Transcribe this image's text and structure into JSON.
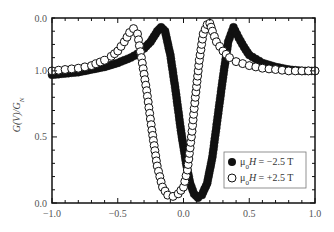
{
  "chart_data": {
    "type": "scatter",
    "title": "",
    "xlabel": "",
    "ylabel": "G(V)/G_N",
    "xlim": [
      -1.0,
      1.0
    ],
    "ylim": [
      0.0,
      1.4
    ],
    "x_ticks": [
      "-1.0",
      "-0.5",
      "0.0",
      "0.5",
      "1.0"
    ],
    "y_tick_labels": [
      {
        "value": 0.0,
        "label": "0.0"
      },
      {
        "value": 0.5,
        "label": "0.5"
      },
      {
        "value": 1.0,
        "label": "1.0"
      },
      {
        "value": 1.4,
        "label": "0.0"
      }
    ],
    "grid": false,
    "legend_position": "lower right",
    "series": [
      {
        "name": "μ0H = −2.5 T",
        "marker": "filled-circle",
        "color": "#111111",
        "x": [
          -1.0,
          -0.9,
          -0.8,
          -0.7,
          -0.6,
          -0.5,
          -0.4,
          -0.35,
          -0.3,
          -0.25,
          -0.2,
          -0.17,
          -0.14,
          -0.1,
          -0.06,
          -0.02,
          0.02,
          0.05,
          0.08,
          0.11,
          0.14,
          0.18,
          0.22,
          0.26,
          0.3,
          0.34,
          0.38,
          0.42,
          0.46,
          0.5,
          0.6,
          0.7,
          0.8,
          0.9,
          1.0
        ],
        "y": [
          0.97,
          0.98,
          0.99,
          1.01,
          1.03,
          1.06,
          1.1,
          1.13,
          1.17,
          1.22,
          1.3,
          1.33,
          1.3,
          1.12,
          0.85,
          0.55,
          0.3,
          0.15,
          0.07,
          0.04,
          0.06,
          0.15,
          0.35,
          0.65,
          0.95,
          1.22,
          1.33,
          1.25,
          1.18,
          1.12,
          1.06,
          1.03,
          1.01,
          1.0,
          1.0
        ]
      },
      {
        "name": "μ0H = +2.5 T",
        "marker": "open-circle",
        "color": "#111111",
        "x": [
          -1.0,
          -0.9,
          -0.8,
          -0.7,
          -0.6,
          -0.55,
          -0.5,
          -0.45,
          -0.41,
          -0.38,
          -0.35,
          -0.32,
          -0.28,
          -0.24,
          -0.2,
          -0.16,
          -0.12,
          -0.08,
          -0.04,
          0.0,
          0.03,
          0.06,
          0.09,
          0.12,
          0.15,
          0.18,
          0.2,
          0.22,
          0.25,
          0.3,
          0.35,
          0.4,
          0.5,
          0.6,
          0.7,
          0.8,
          0.9,
          1.0
        ],
        "y": [
          1.0,
          1.01,
          1.02,
          1.04,
          1.08,
          1.11,
          1.15,
          1.22,
          1.29,
          1.32,
          1.28,
          1.1,
          0.85,
          0.55,
          0.28,
          0.12,
          0.06,
          0.05,
          0.07,
          0.12,
          0.25,
          0.5,
          0.8,
          1.08,
          1.28,
          1.35,
          1.36,
          1.3,
          1.22,
          1.15,
          1.1,
          1.07,
          1.04,
          1.02,
          1.01,
          1.0,
          1.0,
          1.0
        ]
      }
    ]
  },
  "legend": {
    "items": [
      {
        "label": "μ0H = −2.5 T",
        "marker": "filled"
      },
      {
        "label": "μ0H = +2.5 T",
        "marker": "open"
      }
    ]
  }
}
